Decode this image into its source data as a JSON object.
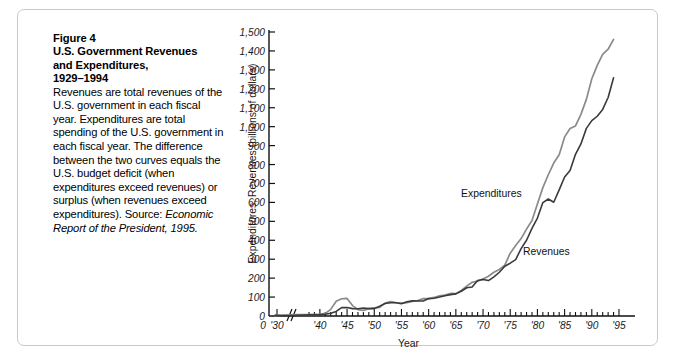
{
  "figure": {
    "number_label": "Figure 4",
    "title_line1": "U.S. Government Revenues",
    "title_line2": "and Expenditures,",
    "title_line3": "1929–1994",
    "caption_body": "Revenues are total revenues of the U.S. government in each fiscal year. Expenditures are total spending of the U.S. government in each fiscal year. The difference between the two curves equals the U.S. budget deficit (when expenditures exceed revenues) or surplus (when revenues exceed expenditures). Source:",
    "source_italic": "Economic Report of the President, 1995."
  },
  "chart_data": {
    "type": "line",
    "title": "U.S. Government Revenues and Expenditures, 1929–1994",
    "xlabel": "Year",
    "ylabel": "Expenditures, Revenues (billions of dollars)",
    "xlim": [
      1929,
      1995
    ],
    "ylim": [
      0,
      1500
    ],
    "grid": false,
    "axis_break_after": "'30",
    "legend_position": "inline-annotation",
    "y_ticks": [
      0,
      100,
      200,
      300,
      400,
      500,
      600,
      700,
      800,
      900,
      1000,
      1100,
      1200,
      1300,
      1400,
      1500
    ],
    "y_tick_labels": [
      "0",
      "100",
      "200",
      "300",
      "400",
      "500",
      "600",
      "700",
      "800",
      "900",
      "1,000",
      "1,100",
      "1,200",
      "1,300",
      "1,400",
      "1,500"
    ],
    "x_ticks": [
      1930,
      1940,
      1945,
      1950,
      1955,
      1960,
      1965,
      1970,
      1975,
      1980,
      1985,
      1990,
      1995
    ],
    "x_tick_labels": [
      "'30",
      "'40",
      "'45",
      "'50",
      "'55",
      "'60",
      "'65",
      "'70",
      "'75",
      "'80",
      "'85",
      "'90",
      "'95"
    ],
    "x_minor_tick_step": 1,
    "x": [
      1929,
      1930,
      1931,
      1932,
      1933,
      1934,
      1935,
      1936,
      1937,
      1938,
      1939,
      1940,
      1941,
      1942,
      1943,
      1944,
      1945,
      1946,
      1947,
      1948,
      1949,
      1950,
      1951,
      1952,
      1953,
      1954,
      1955,
      1956,
      1957,
      1958,
      1959,
      1960,
      1961,
      1962,
      1963,
      1964,
      1965,
      1966,
      1967,
      1968,
      1969,
      1970,
      1971,
      1972,
      1973,
      1974,
      1975,
      1976,
      1977,
      1978,
      1979,
      1980,
      1981,
      1982,
      1983,
      1984,
      1985,
      1986,
      1987,
      1988,
      1989,
      1990,
      1991,
      1992,
      1993,
      1994
    ],
    "series": [
      {
        "name": "Expenditures",
        "color": "#8a8a8a",
        "values": [
          3,
          3,
          4,
          5,
          5,
          7,
          7,
          8,
          8,
          7,
          9,
          9,
          14,
          35,
          78,
          91,
          93,
          55,
          34,
          30,
          39,
          43,
          46,
          68,
          76,
          71,
          68,
          71,
          77,
          82,
          92,
          92,
          98,
          107,
          111,
          119,
          118,
          135,
          158,
          178,
          184,
          196,
          210,
          231,
          246,
          269,
          332,
          372,
          409,
          459,
          504,
          591,
          678,
          746,
          808,
          852,
          946,
          990,
          1004,
          1065,
          1144,
          1253,
          1324,
          1382,
          1409,
          1461
        ]
      },
      {
        "name": "Revenues",
        "color": "#3a3a3a",
        "values": [
          4,
          4,
          3,
          2,
          2,
          3,
          4,
          4,
          5,
          6,
          6,
          7,
          9,
          15,
          24,
          44,
          45,
          39,
          38,
          42,
          39,
          39,
          52,
          66,
          70,
          70,
          65,
          75,
          80,
          79,
          79,
          92,
          94,
          100,
          107,
          113,
          117,
          131,
          149,
          153,
          187,
          193,
          187,
          207,
          231,
          263,
          279,
          298,
          356,
          400,
          463,
          517,
          599,
          618,
          601,
          666,
          734,
          769,
          854,
          909,
          991,
          1032,
          1055,
          1091,
          1154,
          1258
        ]
      }
    ],
    "annotations": [
      {
        "text": "Expenditures",
        "near_year": 1977,
        "near_value": 700
      },
      {
        "text": "Revenues",
        "near_year": 1985,
        "near_value": 420
      }
    ]
  }
}
